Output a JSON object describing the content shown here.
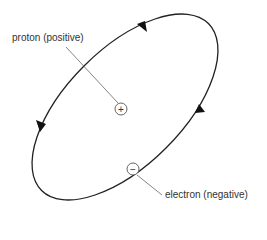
{
  "diagram": {
    "proton_label": "proton (positive)",
    "electron_label": "electron (negative)",
    "proton_symbol": "+",
    "electron_symbol": "−"
  }
}
